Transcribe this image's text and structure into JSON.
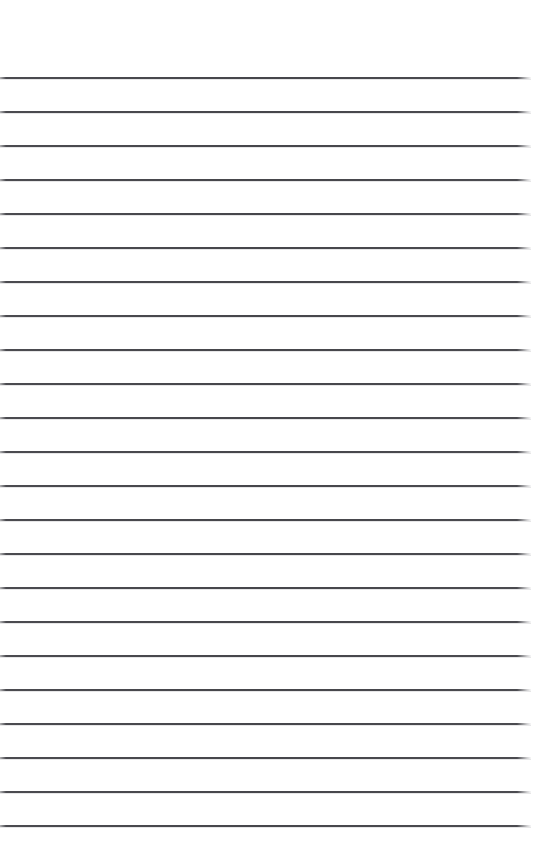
{
  "page": {
    "kind": "lined-paper",
    "background_color": "#ffffff",
    "width": 537,
    "height": 863,
    "text_content": "",
    "visible_text": []
  },
  "ruling": {
    "line_color": "#46464b",
    "line_thickness_px": 2,
    "line_count": 23,
    "first_line_y": 77,
    "line_spacing_px": 34,
    "line_start_x": 0,
    "line_end_x": 531,
    "top_margin_px": 77,
    "bottom_margin_px": 22,
    "lines": [
      {
        "index": 1,
        "y": 77,
        "x_start": 0,
        "x_end": 531
      },
      {
        "index": 2,
        "y": 111,
        "x_start": 0,
        "x_end": 531
      },
      {
        "index": 3,
        "y": 145,
        "x_start": 0,
        "x_end": 531
      },
      {
        "index": 4,
        "y": 179,
        "x_start": 0,
        "x_end": 531
      },
      {
        "index": 5,
        "y": 213,
        "x_start": 0,
        "x_end": 531
      },
      {
        "index": 6,
        "y": 247,
        "x_start": 0,
        "x_end": 531
      },
      {
        "index": 7,
        "y": 281,
        "x_start": 0,
        "x_end": 531
      },
      {
        "index": 8,
        "y": 315,
        "x_start": 0,
        "x_end": 531
      },
      {
        "index": 9,
        "y": 349,
        "x_start": 0,
        "x_end": 531
      },
      {
        "index": 10,
        "y": 383,
        "x_start": 0,
        "x_end": 531
      },
      {
        "index": 11,
        "y": 417,
        "x_start": 0,
        "x_end": 531
      },
      {
        "index": 12,
        "y": 451,
        "x_start": 0,
        "x_end": 531
      },
      {
        "index": 13,
        "y": 485,
        "x_start": 0,
        "x_end": 531
      },
      {
        "index": 14,
        "y": 519,
        "x_start": 0,
        "x_end": 531
      },
      {
        "index": 15,
        "y": 553,
        "x_start": 0,
        "x_end": 531
      },
      {
        "index": 16,
        "y": 587,
        "x_start": 0,
        "x_end": 531
      },
      {
        "index": 17,
        "y": 621,
        "x_start": 0,
        "x_end": 531
      },
      {
        "index": 18,
        "y": 655,
        "x_start": 0,
        "x_end": 531
      },
      {
        "index": 19,
        "y": 689,
        "x_start": 0,
        "x_end": 531
      },
      {
        "index": 20,
        "y": 723,
        "x_start": 0,
        "x_end": 531
      },
      {
        "index": 21,
        "y": 757,
        "x_start": 0,
        "x_end": 531
      },
      {
        "index": 22,
        "y": 791,
        "x_start": 0,
        "x_end": 531
      },
      {
        "index": 23,
        "y": 825,
        "x_start": 0,
        "x_end": 531
      }
    ]
  }
}
